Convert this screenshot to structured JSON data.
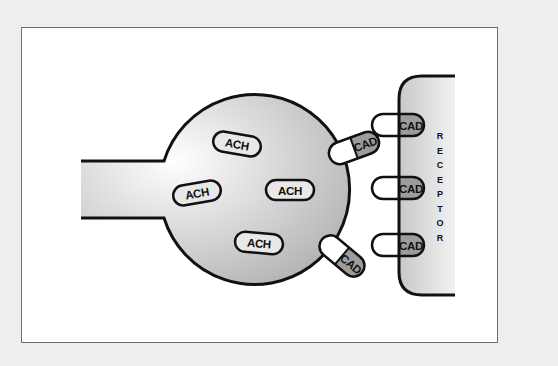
{
  "diagram": {
    "type": "neuromuscular-junction",
    "colors": {
      "background": "#eeeeee",
      "frame_fill": "#ffffff",
      "frame_border": "#6e6e6e",
      "outline": "#111111",
      "gradient_light": "#ffffff",
      "gradient_dark": "#b8b8b8",
      "cad_fill": "#9c9c9c",
      "pill_fill": "#ffffff"
    },
    "nerve_terminal": {
      "label": "",
      "molecules": [
        {
          "label": "ACH",
          "x": 237,
          "y": 144,
          "rotate": 10
        },
        {
          "label": "ACH",
          "x": 197,
          "y": 193,
          "rotate": -10
        },
        {
          "label": "ACH",
          "x": 290,
          "y": 190,
          "rotate": 0
        },
        {
          "label": "ACH",
          "x": 259,
          "y": 243,
          "rotate": 5
        }
      ]
    },
    "free_molecules": [
      {
        "label": "CAD",
        "x": 354,
        "y": 148,
        "rotate": -20
      },
      {
        "label": "CAD",
        "x": 342,
        "y": 256,
        "rotate": 40
      }
    ],
    "receptor": {
      "label": "RECEPTOR",
      "letters": [
        "R",
        "E",
        "C",
        "E",
        "P",
        "T",
        "O",
        "R"
      ],
      "bound_molecules": [
        {
          "label": "CAD",
          "x": 398,
          "y": 125
        },
        {
          "label": "CAD",
          "x": 398,
          "y": 188
        },
        {
          "label": "CAD",
          "x": 398,
          "y": 245
        }
      ]
    }
  }
}
